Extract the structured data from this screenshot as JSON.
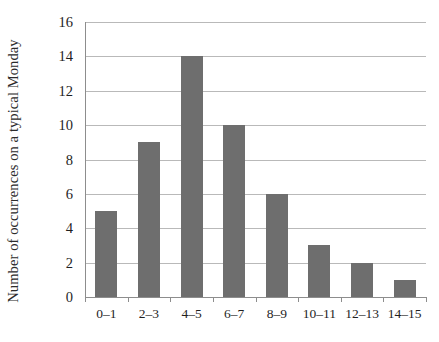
{
  "chart_data": {
    "type": "bar",
    "title": "",
    "subtitle": "",
    "xlabel": "",
    "ylabel": "Number of occurrences on a typical Monday",
    "categories": [
      "0–1",
      "2–3",
      "4–5",
      "6–7",
      "8–9",
      "10–11",
      "12–13",
      "14–15"
    ],
    "values": [
      5,
      9,
      14,
      10,
      6,
      3,
      2,
      1
    ],
    "ylim": [
      0,
      16
    ],
    "ytick_labels": [
      "0",
      "2",
      "4",
      "6",
      "8",
      "10",
      "12",
      "14",
      "16"
    ],
    "ytick_values": [
      0,
      2,
      4,
      6,
      8,
      10,
      12,
      14,
      16
    ],
    "grid": "horizontal",
    "legend": "none",
    "bar_color": "#6e6e6e",
    "gridline_color": "#b9b9b9",
    "axis_color": "#8d8d8d"
  }
}
